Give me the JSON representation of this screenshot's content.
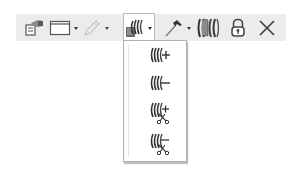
{
  "toolbar": {
    "background": "#ececec",
    "buttons": [
      {
        "id": "properties",
        "icon": "properties-icon",
        "label": "Properties",
        "has_dropdown": false
      },
      {
        "id": "window",
        "icon": "window-frame-icon",
        "label": "Window",
        "has_dropdown": true
      },
      {
        "id": "pencil",
        "icon": "pencil-icon",
        "label": "Edit",
        "has_dropdown": true,
        "disabled": true
      },
      {
        "id": "slices",
        "icon": "slices-icon",
        "label": "Slices",
        "has_dropdown": true,
        "active": true
      },
      {
        "id": "hammer",
        "icon": "hammer-icon",
        "label": "Build",
        "has_dropdown": true
      },
      {
        "id": "surface",
        "icon": "surface-stack-icon",
        "label": "Surface",
        "has_dropdown": false
      },
      {
        "id": "lock",
        "icon": "lock-icon",
        "label": "Lock",
        "has_dropdown": false
      },
      {
        "id": "close",
        "icon": "close-icon",
        "label": "Close",
        "has_dropdown": false
      }
    ]
  },
  "dropdown": {
    "items": [
      {
        "icon": "slices-add-icon",
        "label": "Add slice"
      },
      {
        "icon": "slices-remove-icon",
        "label": "Remove slice"
      },
      {
        "icon": "slices-add-cut-icon",
        "label": "Add cut slice"
      },
      {
        "icon": "slices-remove-cut-icon",
        "label": "Remove cut slice"
      }
    ]
  }
}
